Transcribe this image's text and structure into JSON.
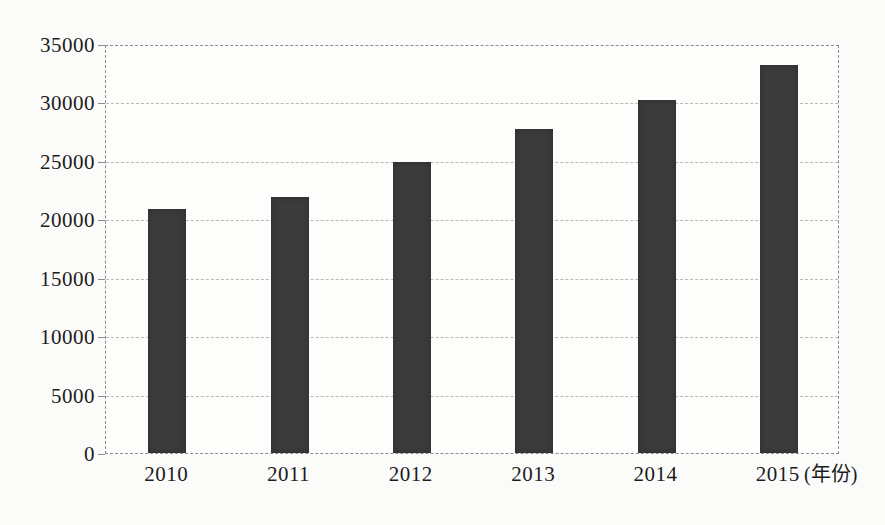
{
  "figure": {
    "title": ""
  },
  "chart_data": {
    "type": "bar",
    "title": "",
    "categories": [
      "2010",
      "2011",
      "2012",
      "2013",
      "2014",
      "2015"
    ],
    "values": [
      21000,
      22000,
      25000,
      27800,
      30300,
      33300
    ],
    "x_unit_label": "(年份)",
    "xlabel": "",
    "ylabel": "",
    "ylim": [
      0,
      35000
    ],
    "ytick_step": 5000,
    "yticks": [
      0,
      5000,
      10000,
      15000,
      20000,
      25000,
      30000,
      35000
    ],
    "grid": "horizontal-dashed",
    "legend_position": "none",
    "bar_color": "#3b3b3b"
  },
  "colors": {
    "bar": "#3b3b3b",
    "gridline": "#b9b9b6",
    "axis_border": "#8d8d8d",
    "text": "#1c1c1c",
    "background": "#fbfbfa"
  }
}
